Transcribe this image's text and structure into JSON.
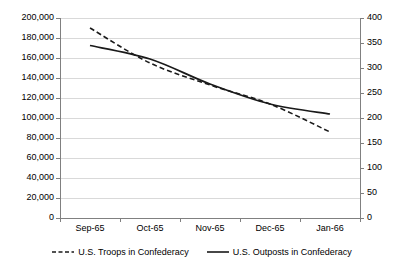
{
  "chart_data": {
    "type": "line",
    "title": "",
    "xlabel": "",
    "ylabel": "",
    "grid": true,
    "legend_position": "bottom-center",
    "categories": [
      "Sep-65",
      "Oct-65",
      "Nov-65",
      "Dec-65",
      "Jan-66"
    ],
    "axes": {
      "left": {
        "label": "",
        "min": 0,
        "max": 200000,
        "step": 20000,
        "ticks": [
          "0",
          "20,000",
          "40,000",
          "60,000",
          "80,000",
          "100,000",
          "120,000",
          "140,000",
          "160,000",
          "180,000",
          "200,000"
        ]
      },
      "right": {
        "label": "",
        "min": 0,
        "max": 400,
        "step": 50,
        "ticks": [
          "0",
          "50",
          "100",
          "150",
          "200",
          "250",
          "300",
          "350",
          "400"
        ]
      }
    },
    "series": [
      {
        "name": "U.S. Troops in Confederacy",
        "axis": "left",
        "style": "dashed",
        "color": "#1a1a1a",
        "values": [
          190000,
          155000,
          133000,
          114000,
          86000
        ]
      },
      {
        "name": "U.S. Outposts in Confederacy",
        "axis": "right",
        "style": "solid",
        "color": "#1a1a1a",
        "values": [
          345,
          318,
          268,
          228,
          208
        ]
      }
    ]
  },
  "legend": {
    "items": [
      {
        "label": "U.S. Troops in Confederacy",
        "style": "dashed"
      },
      {
        "label": "U.S. Outposts in Confederacy",
        "style": "solid"
      }
    ]
  },
  "colors": {
    "background": "#ffffff",
    "gridline": "#d9d9d9",
    "axis": "#808080",
    "series": "#1a1a1a",
    "text": "#000000"
  }
}
